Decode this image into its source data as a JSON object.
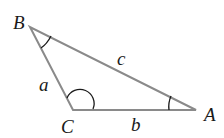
{
  "diagram": {
    "type": "triangle",
    "vertices": {
      "A": {
        "label": "A",
        "x": 196,
        "y": 110
      },
      "B": {
        "label": "B",
        "x": 30,
        "y": 27
      },
      "C": {
        "label": "C",
        "x": 73,
        "y": 110
      }
    },
    "sides": {
      "a": {
        "label": "a",
        "between": [
          "B",
          "C"
        ]
      },
      "b": {
        "label": "b",
        "between": [
          "C",
          "A"
        ]
      },
      "c": {
        "label": "c",
        "between": [
          "A",
          "B"
        ]
      }
    },
    "angle_marks": [
      "B",
      "C",
      "A"
    ],
    "line_color": "#8a8a8a",
    "mark_color": "#1a1a1a"
  }
}
